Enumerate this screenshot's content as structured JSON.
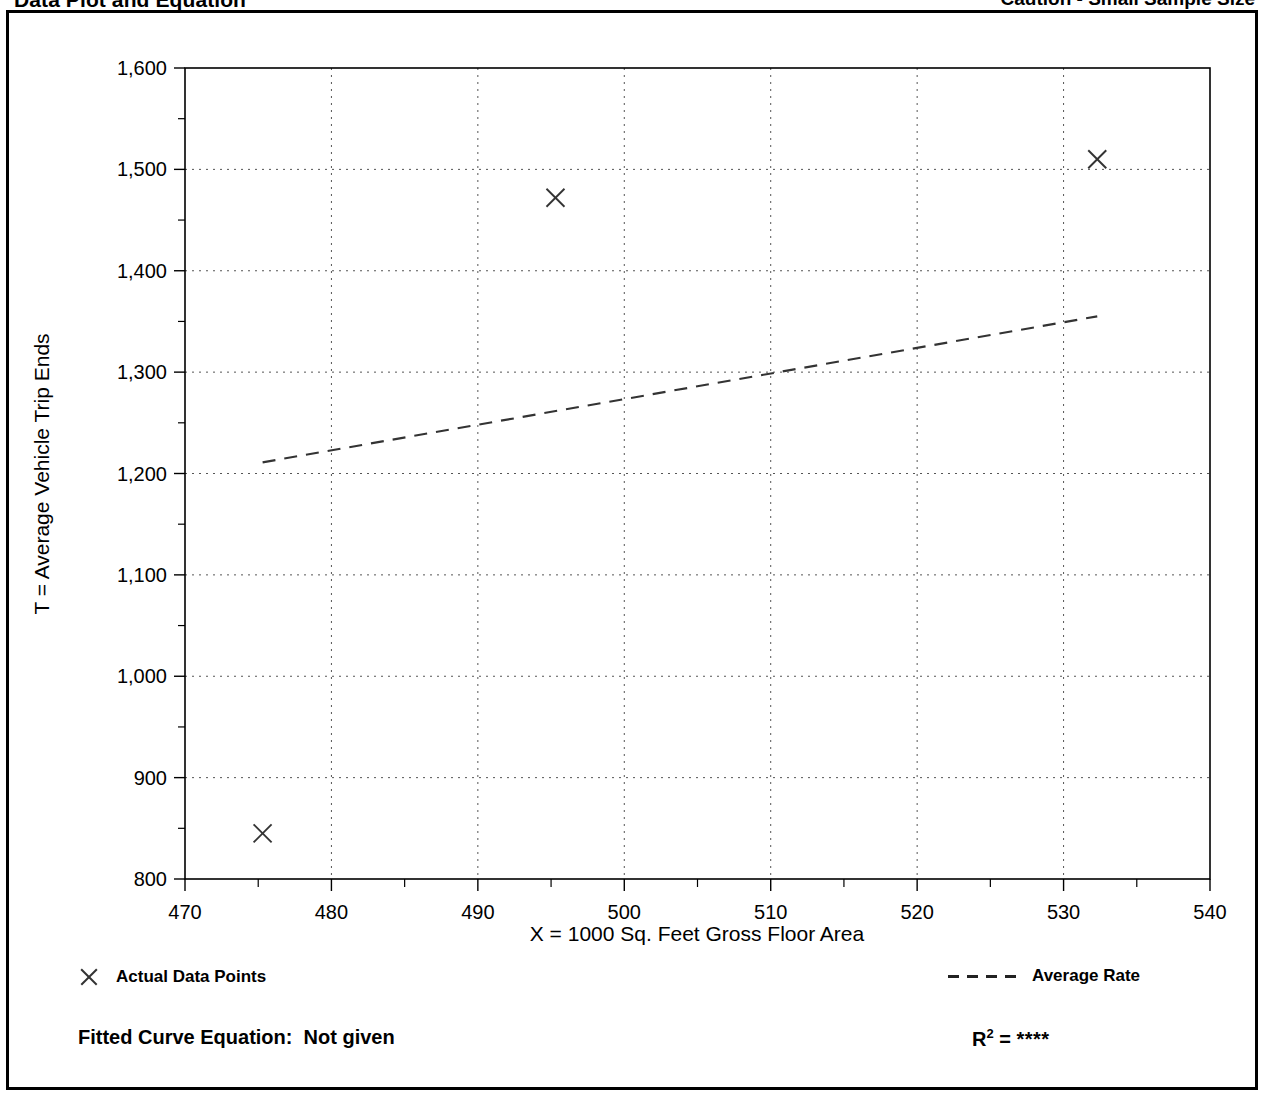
{
  "header": {
    "title": "Data Plot and Equation",
    "note": "Caution - Small Sample Size"
  },
  "chart_data": {
    "type": "scatter",
    "title": "Data Plot and Equation",
    "xlabel": "X = 1000 Sq. Feet Gross Floor Area",
    "ylabel": "T = Average Vehicle Trip Ends",
    "xlim": [
      470,
      540
    ],
    "ylim": [
      800,
      1600
    ],
    "xticks": [
      470,
      480,
      490,
      500,
      510,
      520,
      530,
      540
    ],
    "xtick_labels": [
      "470",
      "480",
      "490",
      "500",
      "510",
      "520",
      "530",
      "540"
    ],
    "xminor_step": 5,
    "yticks": [
      800,
      900,
      1000,
      1100,
      1200,
      1300,
      1400,
      1500,
      1600
    ],
    "ytick_labels": [
      "800",
      "900",
      "1,000",
      "1,100",
      "1,200",
      "1,300",
      "1,400",
      "1,500",
      "1,600"
    ],
    "yminor_step": 50,
    "grid": true,
    "grid_style": "dotted",
    "legend_position": "below-plot",
    "series": [
      {
        "name": "Actual Data Points",
        "type": "scatter",
        "marker": "x",
        "points": [
          {
            "x": 475.3,
            "y": 845
          },
          {
            "x": 495.3,
            "y": 1472
          },
          {
            "x": 532.3,
            "y": 1510
          }
        ]
      },
      {
        "name": "Average Rate",
        "type": "line",
        "style": "dashed",
        "points": [
          {
            "x": 475.3,
            "y": 1211
          },
          {
            "x": 532.3,
            "y": 1355
          }
        ]
      }
    ]
  },
  "legend": {
    "data_points_label": "Actual Data Points",
    "average_rate_label": "Average Rate"
  },
  "equation": {
    "fitted_label": "Fitted Curve Equation:",
    "fitted_value": "Not given",
    "r2_label": "R",
    "r2_exponent": "2",
    "r2_equals": "=",
    "r2_value": "****"
  }
}
